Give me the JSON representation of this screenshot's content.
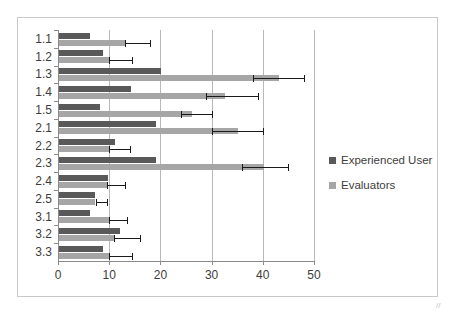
{
  "chart_data": {
    "type": "bar",
    "orientation": "horizontal",
    "title": "",
    "xlabel": "",
    "ylabel": "",
    "xlim": [
      0,
      50
    ],
    "xticks": [
      0,
      10,
      20,
      30,
      40,
      50
    ],
    "xticklabels": [
      "0",
      "10",
      "20",
      "30",
      "40",
      "50"
    ],
    "grid": true,
    "grid_axis": "x",
    "legend_position": "right",
    "categories": [
      "1.1",
      "1.2",
      "1.3",
      "1.4",
      "1.5",
      "2.1",
      "2.2",
      "2.3",
      "2.4",
      "2.5",
      "3.1",
      "3.2",
      "3.3"
    ],
    "series": [
      {
        "name": "Experienced User",
        "color": "#595959",
        "values": [
          6,
          8.5,
          20,
          14,
          8,
          19,
          11,
          19,
          9.5,
          7,
          6,
          12,
          8.5
        ],
        "errors_low": [
          null,
          null,
          null,
          null,
          null,
          null,
          null,
          null,
          null,
          null,
          null,
          null,
          null
        ],
        "errors_high": [
          null,
          null,
          null,
          null,
          null,
          null,
          null,
          null,
          null,
          null,
          null,
          null,
          null
        ]
      },
      {
        "name": "Evaluators",
        "color": "#a6a6a6",
        "values": [
          13,
          10,
          43,
          32.5,
          26,
          35,
          10,
          40,
          9.5,
          7,
          10,
          11,
          10
        ],
        "errors_low": [
          13,
          10,
          38,
          29,
          24,
          30,
          10,
          36,
          9.5,
          7.5,
          10,
          11,
          10
        ],
        "errors_high": [
          18,
          14.5,
          48,
          39,
          30,
          40,
          14,
          45,
          13,
          9.5,
          13.5,
          16,
          14.5
        ]
      }
    ]
  },
  "legend": {
    "items": [
      {
        "label": "Experienced User",
        "swatch": "dark"
      },
      {
        "label": "Evaluators",
        "swatch": "light"
      }
    ]
  }
}
